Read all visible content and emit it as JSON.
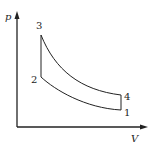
{
  "diagram": {
    "type": "p-V diagram",
    "axes": {
      "y_label": "p",
      "x_label": "V"
    },
    "points": [
      {
        "label": "1",
        "x": 121,
        "y": 110
      },
      {
        "label": "2",
        "x": 41,
        "y": 77
      },
      {
        "label": "3",
        "x": 41,
        "y": 35
      },
      {
        "label": "4",
        "x": 121,
        "y": 95
      }
    ],
    "processes": [
      {
        "from": "1",
        "to": "2",
        "shape": "curve"
      },
      {
        "from": "2",
        "to": "3",
        "shape": "vertical line"
      },
      {
        "from": "3",
        "to": "4",
        "shape": "curve"
      },
      {
        "from": "4",
        "to": "1",
        "shape": "vertical line"
      }
    ],
    "colors": {
      "line": "#222222",
      "background": "#ffffff"
    }
  }
}
